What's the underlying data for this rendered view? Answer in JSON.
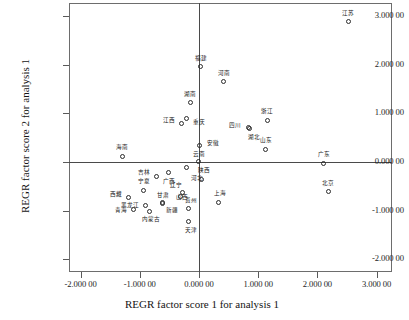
{
  "chart_data": {
    "type": "scatter",
    "title": "",
    "xlabel": "REGR factor score 1 for analysis 1",
    "ylabel": "REGR factor score 2 for analysis 1",
    "xlim": [
      -2.2,
      3.27
    ],
    "ylim": [
      -2.35,
      3.25
    ],
    "grid": false,
    "legend": "none",
    "xticks": [
      "-2.000 00",
      "-1.000 00",
      "0.000 00",
      "1.000 00",
      "2.000 00",
      "3.000 00"
    ],
    "xtick_values": [
      -2,
      -1,
      0,
      1,
      2,
      3
    ],
    "yticks": [
      "3.000 00",
      "2.000 00",
      "1.000 00",
      "0.000 00",
      "-1.000 00",
      "-2.000 00"
    ],
    "ytick_values": [
      3,
      2,
      1,
      0,
      -1,
      -2
    ],
    "marker": "open-circle",
    "points": [
      {
        "label": "江苏",
        "x": 2.52,
        "y": 2.89,
        "lx": 0,
        "ly": -9
      },
      {
        "label": "福建",
        "x": 0.02,
        "y": 1.96,
        "lx": 1,
        "ly": -9
      },
      {
        "label": "河南",
        "x": 0.41,
        "y": 1.65,
        "lx": 1,
        "ly": -9
      },
      {
        "label": "湖南",
        "x": -0.15,
        "y": 1.22,
        "lx": 0,
        "ly": -9
      },
      {
        "label": "江西",
        "x": -0.29,
        "y": 0.8,
        "lx": -13,
        "ly": -3
      },
      {
        "label": "重庆",
        "x": -0.21,
        "y": 0.9,
        "lx": 12,
        "ly": 4
      },
      {
        "label": "浙江",
        "x": 1.15,
        "y": 0.86,
        "lx": 0,
        "ly": -9
      },
      {
        "label": "四川",
        "x": 0.84,
        "y": 0.7,
        "lx": -14,
        "ly": -3
      },
      {
        "label": "湖北",
        "x": 0.86,
        "y": 0.68,
        "lx": 4,
        "ly": 8
      },
      {
        "label": "山东",
        "x": 1.13,
        "y": 0.26,
        "lx": 0,
        "ly": -9
      },
      {
        "label": "安徽",
        "x": 0.01,
        "y": 0.33,
        "lx": 13,
        "ly": -3
      },
      {
        "label": "海南",
        "x": -1.3,
        "y": 0.12,
        "lx": 0,
        "ly": -9
      },
      {
        "label": "云南",
        "x": -0.01,
        "y": 0.01,
        "lx": 1,
        "ly": -8
      },
      {
        "label": "广东",
        "x": 2.11,
        "y": -0.03,
        "lx": 0,
        "ly": -9
      },
      {
        "label": "吉林",
        "x": -0.72,
        "y": -0.29,
        "lx": -12,
        "ly": -4
      },
      {
        "label": "广西",
        "x": -0.52,
        "y": -0.22,
        "lx": 1,
        "ly": 8
      },
      {
        "label": "河北",
        "x": -0.21,
        "y": -0.12,
        "lx": 10,
        "ly": 10
      },
      {
        "label": "陕西",
        "x": 0.05,
        "y": -0.35,
        "lx": 2,
        "ly": -9
      },
      {
        "label": "宁夏",
        "x": -0.93,
        "y": -0.58,
        "lx": 0,
        "ly": -9
      },
      {
        "label": "西藏",
        "x": -1.19,
        "y": -0.74,
        "lx": -13,
        "ly": -4
      },
      {
        "label": "辽宁",
        "x": -0.28,
        "y": -0.63,
        "lx": -6,
        "ly": -8
      },
      {
        "label": "甘肃",
        "x": -0.62,
        "y": -0.84,
        "lx": 1,
        "ly": -8
      },
      {
        "label": "山西",
        "x": -0.31,
        "y": -0.72,
        "lx": 1,
        "ly": 0
      },
      {
        "label": "贵州",
        "x": -0.17,
        "y": -0.95,
        "lx": 2,
        "ly": -8
      },
      {
        "label": "黑龙江",
        "x": -0.9,
        "y": -0.9,
        "lx": -16,
        "ly": -1
      },
      {
        "label": "新疆",
        "x": -0.62,
        "y": -0.86,
        "lx": 10,
        "ly": 6
      },
      {
        "label": "青海",
        "x": -1.1,
        "y": -0.98,
        "lx": -13,
        "ly": 0
      },
      {
        "label": "内蒙古",
        "x": -0.83,
        "y": -1.01,
        "lx": 1,
        "ly": 8
      },
      {
        "label": "北京",
        "x": 2.18,
        "y": -0.61,
        "lx": 0,
        "ly": -9
      },
      {
        "label": "上海",
        "x": 0.33,
        "y": -0.83,
        "lx": 1,
        "ly": -9
      },
      {
        "label": "天津",
        "x": -0.17,
        "y": -1.22,
        "lx": 2,
        "ly": 9
      }
    ]
  }
}
